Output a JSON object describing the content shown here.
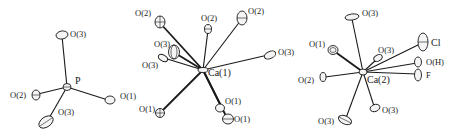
{
  "figure": {
    "panels": [
      {
        "id": "po4",
        "center": {
          "label": "P"
        },
        "ligands": [
          {
            "label": "O(3)"
          },
          {
            "label": "O(2)"
          },
          {
            "label": "O(1)"
          },
          {
            "label": "O(3)"
          }
        ]
      },
      {
        "id": "ca1",
        "center": {
          "label": "Ca(1)"
        },
        "ligands": [
          {
            "label": "O(2)"
          },
          {
            "label": "O(2)"
          },
          {
            "label": "O(2)"
          },
          {
            "label": "O(3)"
          },
          {
            "label": "O(3)"
          },
          {
            "label": "O(3)"
          },
          {
            "label": "O(1)"
          },
          {
            "label": "O(1)"
          },
          {
            "label": "O(1)"
          }
        ]
      },
      {
        "id": "ca2",
        "center": {
          "label": "Ca(2)"
        },
        "ligands": [
          {
            "label": "O(3)"
          },
          {
            "label": "O(1)"
          },
          {
            "label": "O(3)"
          },
          {
            "label": "Cl"
          },
          {
            "label": "O(H)"
          },
          {
            "label": "F"
          },
          {
            "label": "O(2)"
          },
          {
            "label": "O(3)"
          },
          {
            "label": "O(3)"
          }
        ]
      }
    ]
  }
}
